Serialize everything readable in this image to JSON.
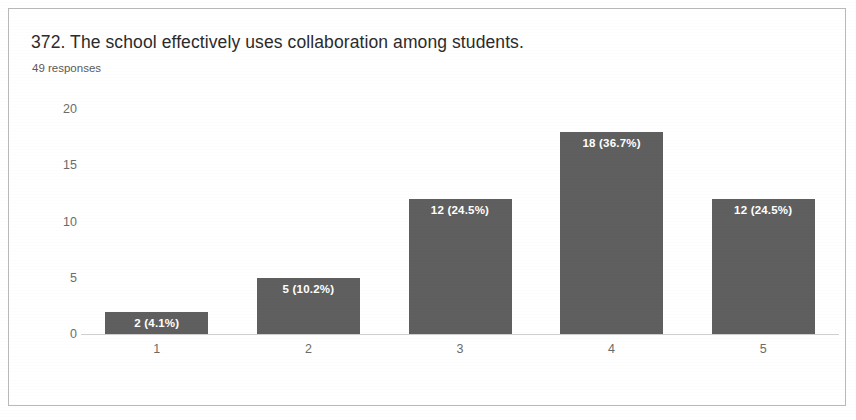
{
  "card": {
    "question_title": "372. The school effectively uses collaboration among students.",
    "response_count": "49 responses"
  },
  "chart_data": {
    "type": "bar",
    "title": "372. The school effectively uses collaboration among students.",
    "subtitle": "49 responses",
    "xlabel": "",
    "ylabel": "",
    "categories": [
      "1",
      "2",
      "3",
      "4",
      "5"
    ],
    "values": [
      2,
      5,
      12,
      18,
      12
    ],
    "percentages": [
      "4.1%",
      "10.2%",
      "24.5%",
      "36.7%",
      "24.5%"
    ],
    "data_labels": [
      "2 (4.1%)",
      "5 (10.2%)",
      "12 (24.5%)",
      "18 (36.7%)",
      "12 (24.5%)"
    ],
    "ylim": [
      0,
      20
    ],
    "yticks": [
      0,
      5,
      10,
      15,
      20
    ],
    "ytick_labels": [
      "0",
      "5",
      "10",
      "15",
      "20"
    ],
    "grid": false,
    "legend": "none",
    "total_responses": 49,
    "bar_color": "#5f5f5f",
    "label_color": "#ffffff",
    "axis_color": "#cfcfcf",
    "tick_text_color": "#6b6b6b"
  }
}
